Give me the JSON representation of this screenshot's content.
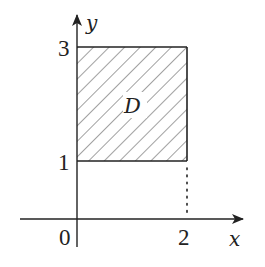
{
  "figure": {
    "region_label": "D",
    "axes": {
      "x_label": "x",
      "y_label": "y",
      "origin_label": "0"
    },
    "ticks": {
      "x": [
        {
          "label": "2",
          "value": 2
        }
      ],
      "y": [
        {
          "label": "1",
          "value": 1
        },
        {
          "label": "3",
          "value": 3
        }
      ]
    },
    "region": {
      "x_min": 0,
      "x_max": 2,
      "y_min": 1,
      "y_max": 3,
      "fill": "diagonal hatching"
    },
    "guide_lines": [
      {
        "style": "dotted",
        "from": [
          2,
          0
        ],
        "to": [
          2,
          1
        ]
      }
    ]
  },
  "colors": {
    "stroke": "#222222",
    "hatch": "#444444",
    "background": "#ffffff"
  }
}
